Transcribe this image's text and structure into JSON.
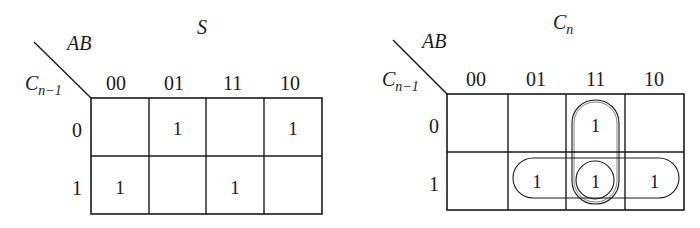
{
  "maps": [
    {
      "title": "S",
      "col_var": "AB",
      "row_var_main": "C",
      "row_var_sub": "n−1",
      "col_headers": [
        "00",
        "01",
        "11",
        "10"
      ],
      "row_headers": [
        "0",
        "1"
      ],
      "cells": [
        [
          "",
          "1",
          "",
          "1"
        ],
        [
          "1",
          "",
          "1",
          ""
        ]
      ],
      "groups": []
    },
    {
      "title_main": "C",
      "title_sub": "n",
      "col_var": "AB",
      "row_var_main": "C",
      "row_var_sub": "n−1",
      "col_headers": [
        "00",
        "01",
        "11",
        "10"
      ],
      "row_headers": [
        "0",
        "1"
      ],
      "cells": [
        [
          "",
          "",
          "1",
          ""
        ],
        [
          "",
          "1",
          "1",
          "1"
        ]
      ],
      "groups": [
        {
          "name": "vertical-group",
          "cells": [
            [
              0,
              2
            ],
            [
              1,
              2
            ]
          ]
        },
        {
          "name": "horizontal-group",
          "cells": [
            [
              1,
              1
            ],
            [
              1,
              2
            ],
            [
              1,
              3
            ]
          ]
        },
        {
          "name": "single-group",
          "cells": [
            [
              1,
              2
            ]
          ]
        }
      ]
    }
  ]
}
